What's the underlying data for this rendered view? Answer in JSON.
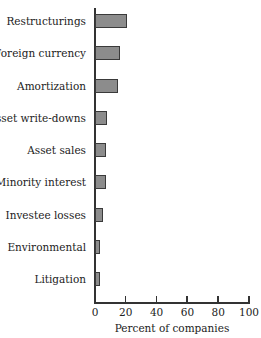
{
  "chart_data": {
    "type": "bar",
    "orientation": "horizontal",
    "title": "",
    "categories": [
      "Restructurings",
      "Foreign currency",
      "Amortization",
      "Asset write-downs",
      "Asset sales",
      "Minority interest",
      "Investee losses",
      "Environmental",
      "Litigation"
    ],
    "values": [
      21,
      16,
      15,
      8,
      7,
      7,
      5,
      3,
      3
    ],
    "xlabel": "Percent of companies",
    "ylabel": "",
    "xlim": [
      0,
      100
    ],
    "xticks": [
      "0",
      "20",
      "40",
      "60",
      "80",
      "100"
    ],
    "grid": false,
    "legend": null,
    "bar_color": "#8c8c8c"
  }
}
